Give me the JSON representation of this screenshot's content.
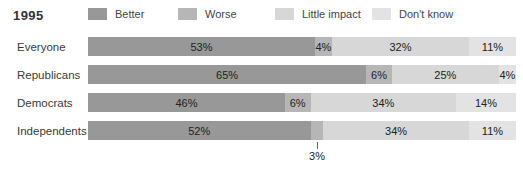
{
  "title": "1995",
  "colors": {
    "better": "#989898",
    "worse": "#b6b6b6",
    "little_impact": "#d7d7d7",
    "dont_know": "#e3e3e3"
  },
  "legend": [
    {
      "label": "Better",
      "color_key": "better"
    },
    {
      "label": "Worse",
      "color_key": "worse"
    },
    {
      "label": "Little impact",
      "color_key": "little_impact"
    },
    {
      "label": "Don't know",
      "color_key": "dont_know"
    }
  ],
  "chart_data": {
    "type": "bar",
    "stacked": true,
    "orientation": "horizontal",
    "unit": "%",
    "title": "1995",
    "series_names": [
      "Better",
      "Worse",
      "Little impact",
      "Don't know"
    ],
    "series_color_keys": [
      "better",
      "worse",
      "little_impact",
      "dont_know"
    ],
    "categories": [
      "Everyone",
      "Republicans",
      "Democrats",
      "Independents"
    ],
    "rows": [
      {
        "category": "Everyone",
        "values": [
          53,
          4,
          32,
          11
        ],
        "labels": [
          "53%",
          "4%",
          "32%",
          "11%"
        ]
      },
      {
        "category": "Republicans",
        "values": [
          65,
          6,
          25,
          4
        ],
        "labels": [
          "65%",
          "6%",
          "25%",
          "4%"
        ]
      },
      {
        "category": "Democrats",
        "values": [
          46,
          6,
          34,
          14
        ],
        "labels": [
          "46%",
          "6%",
          "34%",
          "14%"
        ]
      },
      {
        "category": "Independents",
        "values": [
          52,
          3,
          34,
          11
        ],
        "labels": [
          "52%",
          "3%",
          "34%",
          "11%"
        ],
        "callout": {
          "segment_index": 1,
          "label": "3%"
        }
      }
    ],
    "xlim": [
      0,
      100
    ],
    "legend_position": "top",
    "grid": false
  }
}
